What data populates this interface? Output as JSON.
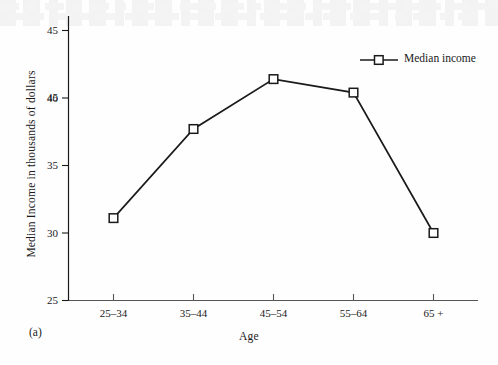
{
  "figure": {
    "panel_label": "(a)",
    "background_color": "#fefefe",
    "ink_color": "#1a1a1a"
  },
  "chart_data": {
    "type": "line",
    "title": "",
    "xlabel": "Age",
    "ylabel": "Median Income in thousands of dollars",
    "categories": [
      "25–34",
      "35–44",
      "45–54",
      "55–64",
      "65 +"
    ],
    "series": [
      {
        "name": "Median income",
        "values": [
          31.1,
          37.7,
          41.4,
          40.4,
          30.0
        ],
        "marker": "open-square",
        "line_color": "#1a1a1a",
        "marker_fill": "#ffffff"
      }
    ],
    "ylim": [
      25,
      45
    ],
    "yticks": [
      25,
      30,
      35,
      40,
      45
    ],
    "ytick_labels": [
      "25",
      "30",
      "35",
      "40",
      "45"
    ],
    "xtick_labels": [
      "25–34",
      "35–44",
      "45–54",
      "55–64",
      "65 +"
    ],
    "grid": false,
    "legend": {
      "position": "top-right",
      "entries": [
        "Median income"
      ]
    }
  }
}
